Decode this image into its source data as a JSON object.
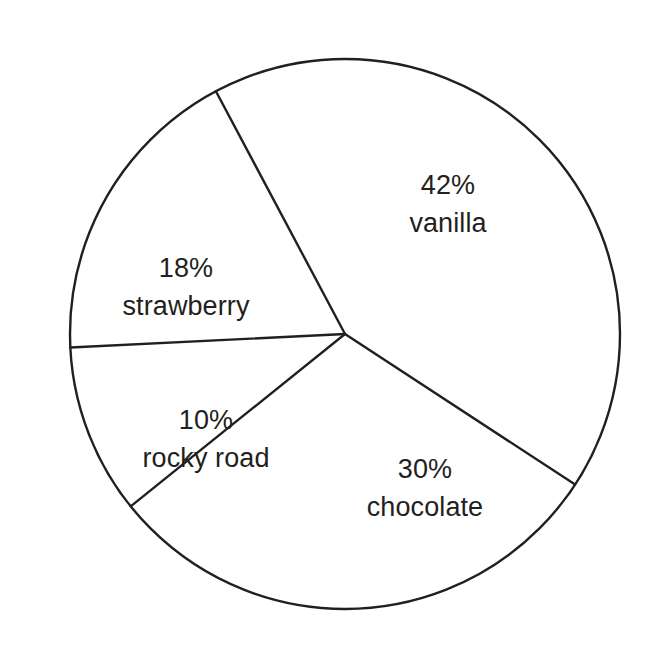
{
  "chart_data": {
    "type": "pie",
    "title": "",
    "subtitle": "",
    "xlabel": "",
    "ylabel": "",
    "legend": "none",
    "grid": false,
    "unit": "%",
    "total": 100,
    "categories": [
      "vanilla",
      "chocolate",
      "strawberry",
      "rocky road"
    ],
    "values": [
      42,
      30,
      18,
      10
    ],
    "slices": [
      {
        "label": "vanilla",
        "value": 42,
        "percent_text": "42%",
        "label_text": "vanilla",
        "fill": "#ffffff",
        "stroke": "#231f20",
        "start_angle_deg": -28,
        "end_angle_deg": 123.2
      },
      {
        "label": "chocolate",
        "value": 30,
        "percent_text": "30%",
        "label_text": "chocolate",
        "fill": "#ffffff",
        "stroke": "#231f20",
        "start_angle_deg": 123.2,
        "end_angle_deg": 231.2
      },
      {
        "label": "rocky road",
        "value": 10,
        "percent_text": "10%",
        "label_text": "rocky road",
        "fill": "#ffffff",
        "stroke": "#231f20",
        "start_angle_deg": 231.2,
        "end_angle_deg": 267.2
      },
      {
        "label": "strawberry",
        "value": 18,
        "percent_text": "18%",
        "label_text": "strawberry",
        "fill": "#ffffff",
        "stroke": "#231f20",
        "start_angle_deg": 267.2,
        "end_angle_deg": 332
      }
    ],
    "geometry": {
      "center_x": 345,
      "center_y": 334,
      "radius": 275,
      "stroke_color": "#231f20",
      "stroke_width": 2.4,
      "background": "#ffffff"
    }
  },
  "labels": {
    "vanilla": {
      "percent": "42%",
      "flavor": "vanilla"
    },
    "chocolate": {
      "percent": "30%",
      "flavor": "chocolate"
    },
    "strawberry": {
      "percent": "18%",
      "flavor": "strawberry"
    },
    "rocky_road": {
      "percent": "10%",
      "flavor": "rocky road"
    }
  },
  "colors": {
    "ink": "#231f20",
    "background": "#ffffff"
  }
}
